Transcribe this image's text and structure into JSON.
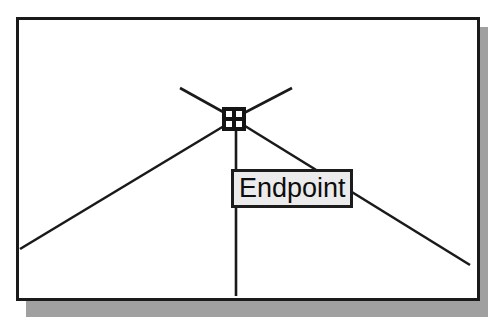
{
  "app": {
    "name": "cad-drawing-view",
    "background_color": "#ffffff"
  },
  "frame": {
    "border_color": "#1a1a1a",
    "fill_color": "#ffffff",
    "shadow_color": "#a0a0a0"
  },
  "drawing": {
    "line_color": "#1a1a1a",
    "geometry_description": "roof outline with vertical centre line and crossing construction lines"
  },
  "snap_marker": {
    "type": "endpoint-square-marker",
    "color": "#151515"
  },
  "tooltip": {
    "label": "Endpoint",
    "fill_color": "#ebebeb",
    "border_color": "#1c1c1c",
    "text_color": "#0d0d0d"
  }
}
